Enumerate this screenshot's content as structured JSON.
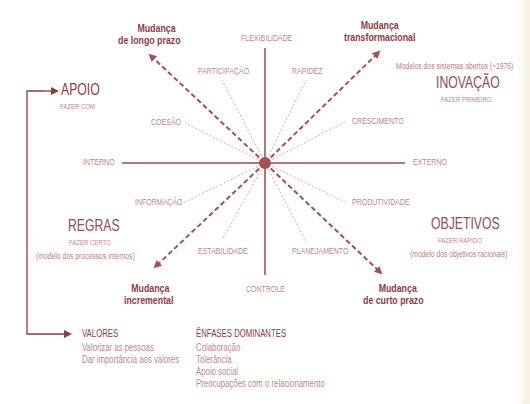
{
  "diagram": {
    "axes": {
      "top": "FLEXIBILIDADE",
      "bottom": "CONTROLE",
      "left": "INTERNO",
      "right": "EXTERNO"
    },
    "radial_labels": {
      "participacao": "PARTICIPAÇÃO",
      "rapidez": "RAPIDEZ",
      "coesao": "COESÃO",
      "crescimento": "CRESCIMENTO",
      "informacao": "INFORMAÇÃO",
      "produtividade": "PRODUTIVIDADE",
      "estabilidade": "ESTABILIDADE",
      "planejamento": "PLANEJAMENTO"
    },
    "change_arrows": {
      "long_term": [
        "Mudança",
        "de longo prazo"
      ],
      "transformational": [
        "Mudança",
        "transformacional"
      ],
      "incremental": [
        "Mudança",
        "incremental"
      ],
      "short_term": [
        "Mudança",
        "de curto prazo"
      ]
    },
    "quadrants": {
      "apoio": {
        "title": "APOIO",
        "subtitle": "FAZER COM"
      },
      "inovacao": {
        "note": "Modelos dos sistemas abertos (~1976)",
        "title": "INOVAÇÃO",
        "subtitle": "FAZER PRIMEIRO"
      },
      "regras": {
        "title": "REGRAS",
        "subtitle": "FAZER CERTO",
        "note": "(modelo dos processos internos)"
      },
      "objetivos": {
        "title": "OBJETIVOS",
        "subtitle": "FAZER RÁPIDO",
        "note": "(modelo dos objetivos racionais)"
      }
    },
    "legend": {
      "valores": {
        "title": "VALORES",
        "items": [
          "Valorizar as pessoas",
          "Dar importância aos valores"
        ]
      },
      "enfases": {
        "title": "ÊNFASES DOMINANTES",
        "items": [
          "Colaboração",
          "Tolerância",
          "Apoio social",
          "Preocupações com o relacionamento"
        ]
      }
    },
    "colors": {
      "primary": "#8e3b3d",
      "label": "#bf8684",
      "dashed": "#a8504f"
    }
  }
}
